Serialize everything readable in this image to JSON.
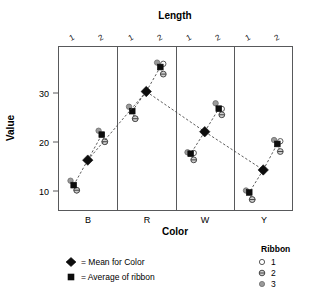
{
  "chart_data": {
    "type": "scatter",
    "title": "Length",
    "xlabel": "Color",
    "ylabel": "Value",
    "ylim": [
      7,
      38
    ],
    "yticks": [
      10,
      20,
      30
    ],
    "ytick_labels": [
      "10",
      "20",
      "30"
    ],
    "grid": false,
    "panel_axis": "Color",
    "panels": [
      "B",
      "R",
      "W",
      "Y"
    ],
    "strip_axis": "Length",
    "strip_levels": [
      "1",
      "2"
    ],
    "legend_position": "bottom-right",
    "series": [
      {
        "name": "1",
        "marker": "open-circle"
      },
      {
        "name": "2",
        "marker": "circle-with-bar"
      },
      {
        "name": "3",
        "marker": "filled-gray-circle"
      }
    ],
    "groups": [
      {
        "color": "B",
        "mean": 16.3,
        "cells": [
          {
            "length": "1",
            "average": 11.2,
            "ribbons": {
              "1": 10.4,
              "2": 10.4,
              "3": 12.1
            }
          },
          {
            "length": "2",
            "average": 21.5,
            "ribbons": {
              "1": 20.3,
              "2": 20.3,
              "3": 22.3
            }
          }
        ]
      },
      {
        "color": "R",
        "mean": 30.3,
        "cells": [
          {
            "length": "1",
            "average": 26.3,
            "ribbons": {
              "1": 25.0,
              "2": 25.0,
              "3": 27.2
            }
          },
          {
            "length": "2",
            "average": 35.3,
            "ribbons": {
              "1": 36.2,
              "2": 34.1,
              "3": 36.2
            }
          }
        ]
      },
      {
        "color": "W",
        "mean": 22.1,
        "cells": [
          {
            "length": "1",
            "average": 17.6,
            "ribbons": {
              "1": 18.0,
              "2": 16.6,
              "3": 17.9
            }
          },
          {
            "length": "2",
            "average": 26.8,
            "ribbons": {
              "1": 27.0,
              "2": 25.8,
              "3": 27.9
            }
          }
        ]
      },
      {
        "color": "Y",
        "mean": 14.3,
        "cells": [
          {
            "length": "1",
            "average": 9.7,
            "ribbons": {
              "1": 8.5,
              "2": 8.5,
              "3": 10.1
            }
          },
          {
            "length": "2",
            "average": 19.6,
            "ribbons": {
              "1": 20.4,
              "2": 18.3,
              "3": 20.4
            }
          }
        ]
      }
    ]
  },
  "titles": {
    "top": "Length",
    "xaxis": "Color",
    "yaxis": "Value"
  },
  "axis": {
    "y_tick_1": "10",
    "y_tick_2": "20",
    "y_tick_3": "30"
  },
  "panel_labels": {
    "p0": "B",
    "p1": "R",
    "p2": "W",
    "p3": "Y"
  },
  "strip_labels": {
    "p0_l1": "1",
    "p0_l2": "2",
    "p1_l1": "1",
    "p1_l2": "2",
    "p2_l1": "1",
    "p2_l2": "2",
    "p3_l1": "1",
    "p3_l2": "2"
  },
  "legend_marks": {
    "mean_text": "= Mean for Color",
    "avg_text": "= Average of ribbon"
  },
  "legend_ribbon": {
    "title": "Ribbon",
    "item1": "1",
    "item2": "2",
    "item3": "3"
  },
  "colors": {
    "marker_dark": "#0d0d0d",
    "frame": "#58595b",
    "ribbon3_fill": "#9a9a9a",
    "ribbon2_fill": "#cfcfcf",
    "ribbon1_fill": "#ffffff",
    "line": "#4a4a4a"
  }
}
